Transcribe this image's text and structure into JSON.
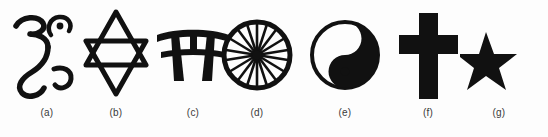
{
  "figure": {
    "background_color": "#fdfdfd",
    "ink_color": "#111111",
    "caption_color": "#3a3a3a",
    "symbols": [
      {
        "label": "(a)",
        "icon_name": "om-icon",
        "name": "Om",
        "left": 8,
        "width": 78
      },
      {
        "label": "(b)",
        "icon_name": "star-of-david-icon",
        "name": "Star of David",
        "left": 76,
        "width": 80
      },
      {
        "label": "(c)",
        "icon_name": "torii-gate-icon",
        "name": "Torii Gate",
        "left": 152,
        "width": 82
      },
      {
        "label": "(d)",
        "icon_name": "dharma-wheel-icon",
        "name": "Dharma Wheel",
        "left": 218,
        "width": 78
      },
      {
        "label": "(e)",
        "icon_name": "yin-yang-icon",
        "name": "Yin Yang",
        "left": 306,
        "width": 78
      },
      {
        "label": "(f)",
        "icon_name": "latin-cross-icon",
        "name": "Latin Cross",
        "left": 390,
        "width": 76
      },
      {
        "label": "(g)",
        "icon_name": "star-and-crescent-icon",
        "name": "Star and Crescent",
        "left": 459,
        "width": 80
      }
    ]
  }
}
